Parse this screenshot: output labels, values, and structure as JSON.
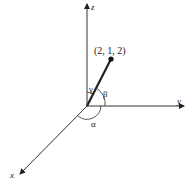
{
  "diagram": {
    "axes": {
      "x": "x",
      "y": "y",
      "z": "z"
    },
    "point_label": "(2, 1, 2)",
    "angles": {
      "alpha": "α",
      "beta": "β",
      "gamma": "γ"
    }
  }
}
